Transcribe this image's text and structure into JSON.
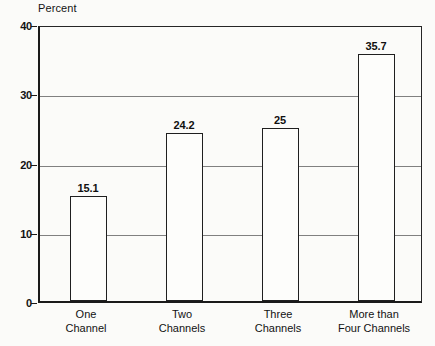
{
  "chart_data": {
    "type": "bar",
    "title": "",
    "subtitle": "",
    "xlabel": "",
    "ylabel": "Percent",
    "ylim": [
      0,
      40
    ],
    "yticks": [
      0,
      10,
      20,
      30,
      40
    ],
    "ytick_labels": [
      "0",
      "10",
      "20",
      "30",
      "40"
    ],
    "grid": true,
    "legend": false,
    "legend_position": "none",
    "categories": [
      "One Channel",
      "Two Channels",
      "Three Channels",
      "More than Four Channels"
    ],
    "category_lines": [
      [
        "One",
        "Channel"
      ],
      [
        "Two",
        "Channels"
      ],
      [
        "Three",
        "Channels"
      ],
      [
        "More than",
        "Four Channels"
      ]
    ],
    "values": [
      15.1,
      24.2,
      25,
      35.7
    ],
    "value_labels": [
      "15.1",
      "24.2",
      "25",
      "35.7"
    ],
    "colors": {
      "background": "#fbfbf9",
      "axis": "#1a1a1a",
      "grid": "#6e6e6e",
      "bar_fill": "#fdfdfb",
      "bar_edge": "#1f1f1f",
      "text": "#121212"
    }
  }
}
